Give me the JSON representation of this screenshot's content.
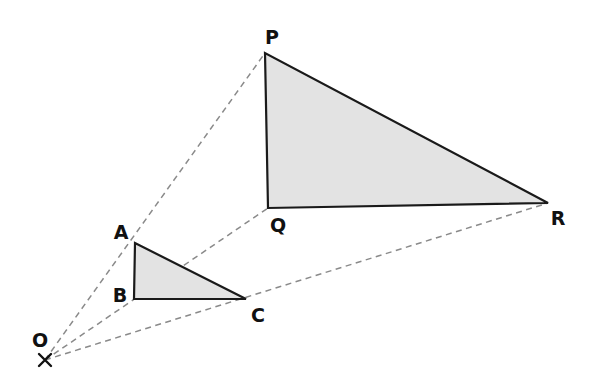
{
  "diagram": {
    "kind": "homothety-enlargement",
    "background_color": "#ffffff",
    "fill_color": "#e3e3e3",
    "outline_color": "#1a1a1a",
    "ray_color": "#8a8a8a",
    "label_color": "#111111",
    "scale_factor": 2.5,
    "canvas": {
      "width": 601,
      "height": 385
    }
  },
  "centre": {
    "name": "O",
    "label": "O",
    "marker": "cross-x-icon",
    "point": {
      "x": 45,
      "y": 360
    },
    "label_pos": {
      "x": 40,
      "y": 341
    }
  },
  "small_triangle": {
    "name": "triangle-abc",
    "vertices": [
      {
        "name": "A",
        "label": "A",
        "x": 135,
        "y": 243,
        "label_x": 121,
        "label_y": 233
      },
      {
        "name": "B",
        "label": "B",
        "x": 134,
        "y": 299,
        "label_x": 120,
        "label_y": 296
      },
      {
        "name": "C",
        "label": "C",
        "x": 246,
        "y": 299,
        "label_x": 258,
        "label_y": 316
      }
    ],
    "path": "M135,243 L134,299 L246,299 Z"
  },
  "large_triangle": {
    "name": "triangle-pqr",
    "vertices": [
      {
        "name": "P",
        "label": "P",
        "x": 265,
        "y": 53,
        "label_x": 272,
        "label_y": 38
      },
      {
        "name": "Q",
        "label": "Q",
        "x": 268,
        "y": 208,
        "label_x": 278,
        "label_y": 226
      },
      {
        "name": "R",
        "label": "R",
        "x": 548,
        "y": 203,
        "label_x": 558,
        "label_y": 219
      }
    ],
    "path": "M265,53 L268,208 L548,203 Z"
  },
  "rays": [
    {
      "name": "ray-o-a-p",
      "from": "O",
      "through": "A",
      "to": "P",
      "path": "M45,360 L265,53"
    },
    {
      "name": "ray-o-b-q",
      "from": "O",
      "through": "B",
      "to": "Q",
      "path": "M45,360 L268,208"
    },
    {
      "name": "ray-o-c-r",
      "from": "O",
      "through": "C",
      "to": "R",
      "path": "M45,360 L548,203"
    }
  ],
  "cross_marker": {
    "name": "centre-cross-icon",
    "arm": 6,
    "path": "M39,354 L51,366 M51,354 L39,366"
  }
}
